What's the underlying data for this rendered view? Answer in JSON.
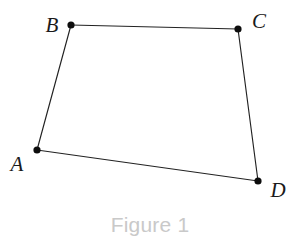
{
  "figure": {
    "caption": "Figure 1",
    "caption_color": "#c9c9c9",
    "background_color": "#ffffff",
    "line_color": "#222222",
    "vertex_color": "#0d0d0d",
    "label_color": "#1a1a1a",
    "width": 301,
    "height": 247,
    "shape_type": "quadrilateral",
    "shape_name": "ABCD"
  },
  "chart_data": {
    "type": "diagram",
    "title": "Figure 1",
    "subtitle": "",
    "xlabel": "",
    "ylabel": "",
    "grid": false,
    "legend": "none",
    "xlim": [
      0,
      301
    ],
    "ylim": [
      0,
      247
    ],
    "shape": "quadrilateral ABCD",
    "vertices": [
      {
        "id": "A",
        "label": "A",
        "x": 37,
        "y": 150,
        "label_x": 17,
        "label_y": 171,
        "label_anchor": "middle"
      },
      {
        "id": "B",
        "label": "B",
        "x": 71,
        "y": 25,
        "label_x": 52,
        "label_y": 32,
        "label_anchor": "middle"
      },
      {
        "id": "C",
        "label": "C",
        "x": 238,
        "y": 29,
        "label_x": 259,
        "label_y": 28,
        "label_anchor": "middle"
      },
      {
        "id": "D",
        "label": "D",
        "x": 258,
        "y": 181,
        "label_x": 278,
        "label_y": 197,
        "label_anchor": "middle"
      }
    ],
    "edges": [
      {
        "id": "AB",
        "from": "A",
        "to": "B",
        "x1": 37,
        "y1": 150,
        "x2": 71,
        "y2": 25
      },
      {
        "id": "BC",
        "from": "B",
        "to": "C",
        "x1": 71,
        "y1": 25,
        "x2": 238,
        "y2": 29
      },
      {
        "id": "CD",
        "from": "C",
        "to": "D",
        "x1": 238,
        "y1": 29,
        "x2": 258,
        "y2": 181
      },
      {
        "id": "DA",
        "from": "D",
        "to": "A",
        "x1": 258,
        "y1": 181,
        "x2": 37,
        "y2": 150
      }
    ],
    "vertex_radius": 3.6,
    "caption_position": {
      "x": 150,
      "y": 232,
      "anchor": "middle"
    }
  }
}
